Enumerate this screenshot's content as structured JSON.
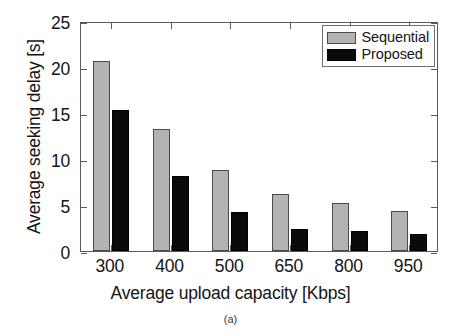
{
  "chart_data": {
    "type": "bar",
    "title": "",
    "subtitle": "",
    "xlabel": "Average upload capacity [Kbps]",
    "ylabel": "Average seeking delay [s]",
    "categories": [
      "300",
      "400",
      "500",
      "650",
      "800",
      "950"
    ],
    "series": [
      {
        "name": "Sequential",
        "color": "#b3b3b3",
        "values": [
          20.65,
          13.25,
          8.8,
          6.2,
          5.25,
          4.4
        ]
      },
      {
        "name": "Proposed",
        "color": "#0a0a0a",
        "values": [
          15.3,
          8.15,
          4.2,
          2.4,
          2.15,
          1.9
        ]
      }
    ],
    "ylim": [
      0,
      25
    ],
    "yticks": [
      0,
      5,
      10,
      15,
      20,
      25
    ],
    "ytick_labels": [
      "0",
      "5",
      "10",
      "15",
      "20",
      "25"
    ],
    "grid": false,
    "legend_position": "top-right"
  },
  "legend": {
    "entries": [
      {
        "label": "Sequential"
      },
      {
        "label": "Proposed"
      }
    ]
  },
  "caption": {
    "text": "(a)"
  }
}
